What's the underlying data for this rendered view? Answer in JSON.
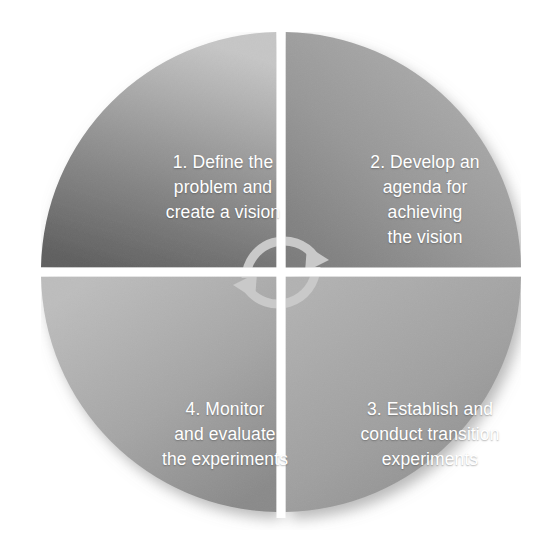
{
  "diagram": {
    "type": "four-quadrant-cycle-wheel",
    "background_color": "#ffffff",
    "label_color": "#ffffff",
    "divider_color": "#ffffff",
    "arrow_color": "#c9c9c9",
    "quadrants": [
      {
        "number": "1",
        "position": "top-left",
        "text": "1. Define the\nproblem and\ncreate a vision",
        "fill_light": "#c2c2c2",
        "fill_dark": "#606060"
      },
      {
        "number": "2",
        "position": "top-right",
        "text": "2. Develop an\nagenda for\nachieving\nthe vision",
        "fill_light": "#a5a5a5",
        "fill_dark": "#7f7f7f"
      },
      {
        "number": "3",
        "position": "bottom-right",
        "text": "3. Establish and\nconduct transition\nexperiments",
        "fill_light": "#ababab",
        "fill_dark": "#8e8e8e"
      },
      {
        "number": "4",
        "position": "bottom-left",
        "text": "4. Monitor\nand evaluate\nthe experiments",
        "fill_light": "#b9b9b9",
        "fill_dark": "#8a8a8a"
      }
    ],
    "center_arrows": [
      {
        "name": "upper-cycle-arrow",
        "direction": "clockwise",
        "sweep": "top-arc-pointing-down-right"
      },
      {
        "name": "lower-cycle-arrow",
        "direction": "clockwise",
        "sweep": "bottom-arc-pointing-up-left"
      }
    ]
  }
}
